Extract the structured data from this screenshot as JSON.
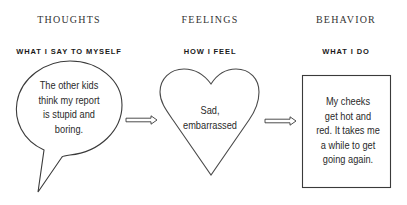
{
  "columns": [
    {
      "title": "THOUGHTS",
      "subtitle": "WHAT I SAY TO MYSELF",
      "shape": "speech-bubble",
      "text": "The other kids think my report is stupid and boring.",
      "lines": [
        "The other kids",
        "think my report",
        "is stupid and",
        "boring."
      ]
    },
    {
      "title": "FEELINGS",
      "subtitle": "HOW I FEEL",
      "shape": "heart",
      "text": "Sad, embarrassed",
      "lines": [
        "Sad,",
        "embarrassed"
      ]
    },
    {
      "title": "BEHAVIOR",
      "subtitle": "WHAT I DO",
      "shape": "rectangle",
      "text": "My cheeks get hot and red. It takes me a while to get going again.",
      "lines": [
        "My cheeks",
        "get hot and",
        "red. It takes me",
        "a while to get",
        "going again."
      ]
    }
  ],
  "connectors": [
    {
      "from": "thoughts",
      "to": "feelings",
      "icon": "double-line-arrow-right"
    },
    {
      "from": "feelings",
      "to": "behavior",
      "icon": "double-line-arrow-right"
    }
  ],
  "colors": {
    "stroke": "#3a3a3a",
    "text": "#2a2a2a",
    "background": "#ffffff"
  }
}
